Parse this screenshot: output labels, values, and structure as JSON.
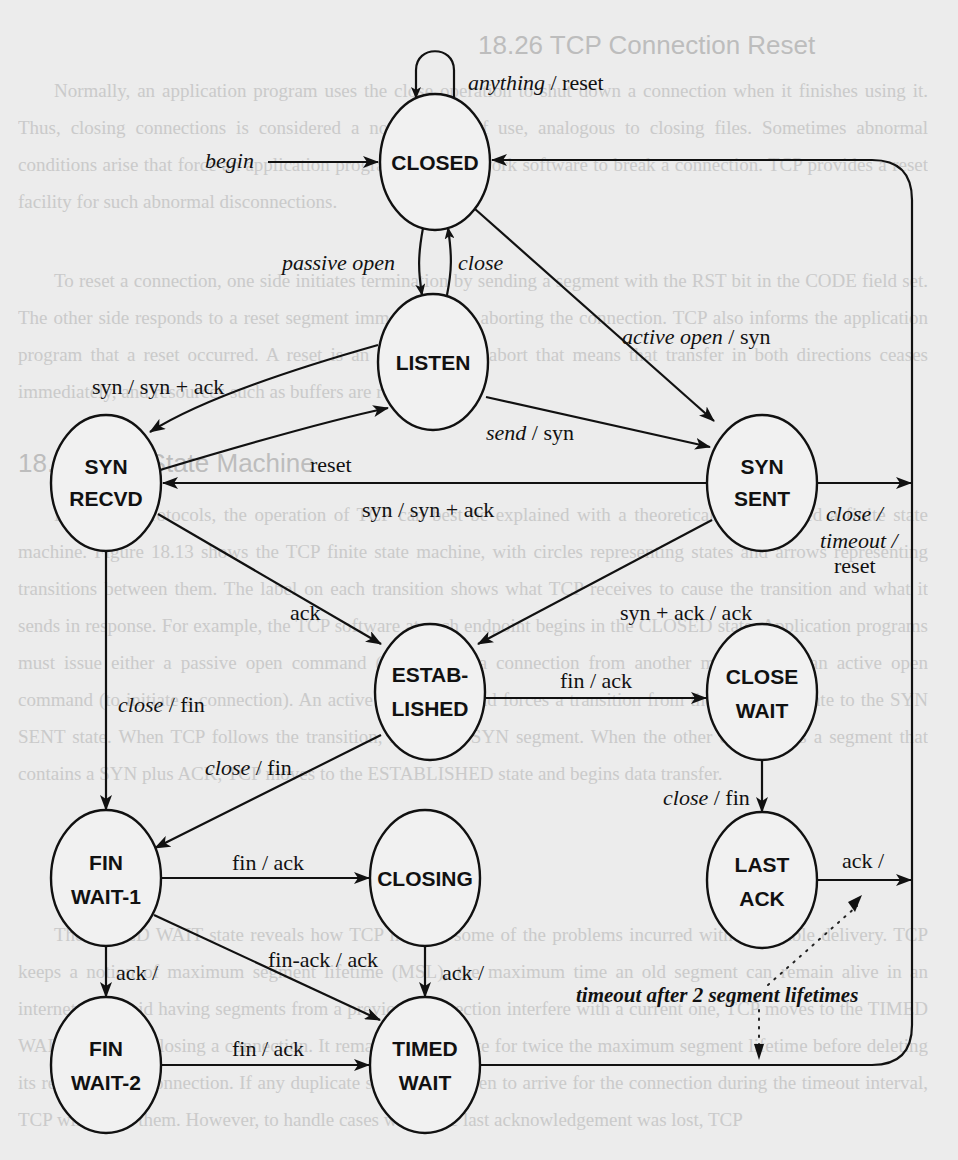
{
  "background_text": {
    "heading_1": "18.26 TCP Connection Reset",
    "para_1": "Normally, an application program uses the close operation to shut down a connection when it finishes using it. Thus, closing connections is considered a normal part of use, analogous to closing files. Sometimes abnormal conditions arise that force an application program or the network software to break a connection. TCP provides a reset facility for such abnormal disconnections.",
    "para_2": "To reset a connection, one side initiates termination by sending a segment with the RST bit in the CODE field set. The other side responds to a reset segment immediately by aborting the connection. TCP also informs the application program that a reset occurred. A reset is an instantaneous abort that means that transfer in both directions ceases immediately, and resources such as buffers are released.",
    "heading_2": "18.27 TCP State Machine",
    "para_3": "Like most protocols, the operation of TCP can best be explained with a theoretical model called a finite state machine. Figure 18.13 shows the TCP finite state machine, with circles representing states and arrows representing transitions between them. The label on each transition shows what TCP receives to cause the transition and what it sends in response. For example, the TCP software at each endpoint begins in the CLOSED state. Application programs must issue either a passive open command (to wait for a connection from another machine), or an active open command (to initiate a connection). An active open command forces a transition from the CLOSED state to the SYN SENT state. When TCP follows the transition, it emits a SYN segment. When the other end returns a segment that contains a SYN plus ACK, TCP moves to the ESTABLISHED state and begins data transfer.",
    "para_4": "The TIMED WAIT state reveals how TCP handles some of the problems incurred with unreliable delivery. TCP keeps a notion of maximum segment lifetime (MSL), the maximum time an old segment can remain alive in an internet. To avoid having segments from a previous connection interfere with a current one, TCP moves to the TIMED WAIT state after closing a connection. It remains in that state for twice the maximum segment lifetime before deleting its record of the connection. If any duplicate segments happen to arrive for the connection during the timeout interval, TCP will reject them. However, to handle cases where the last acknowledgement was lost, TCP"
  },
  "diagram": {
    "states": {
      "closed": [
        "CLOSED"
      ],
      "listen": [
        "LISTEN"
      ],
      "syn_recvd": [
        "SYN",
        "RECVD"
      ],
      "syn_sent": [
        "SYN",
        "SENT"
      ],
      "established": [
        "ESTAB-",
        "LISHED"
      ],
      "close_wait": [
        "CLOSE",
        "WAIT"
      ],
      "fin_wait_1": [
        "FIN",
        "WAIT-1"
      ],
      "closing": [
        "CLOSING"
      ],
      "last_ack": [
        "LAST",
        "ACK"
      ],
      "fin_wait_2": [
        "FIN",
        "WAIT-2"
      ],
      "timed_wait": [
        "TIMED",
        "WAIT"
      ]
    },
    "transitions": {
      "anything_reset": {
        "event": "anything",
        "action": " / reset"
      },
      "begin": {
        "event": "begin"
      },
      "passive_open": {
        "event": "passive open"
      },
      "close_listen": {
        "event": "close"
      },
      "active_open": {
        "event": "active open",
        "action": " / syn"
      },
      "listen_syn": {
        "label": "syn / syn + ack"
      },
      "send_syn": {
        "event": "send",
        "action": " / syn"
      },
      "reset": {
        "label": "reset"
      },
      "simultaneous_syn": {
        "label": "syn / syn + ack"
      },
      "syn_sent_close_1": {
        "event": "close /"
      },
      "syn_sent_close_2": {
        "event": "timeout /"
      },
      "syn_sent_close_3": {
        "label": "reset"
      },
      "ack": {
        "label": "ack"
      },
      "syn_ack_ack": {
        "label": "syn + ack / ack"
      },
      "recvd_close_fin": {
        "event": "close",
        "action": " / fin"
      },
      "fin_ack_est": {
        "label": "fin / ack"
      },
      "est_close_fin": {
        "event": "close",
        "action": " / fin"
      },
      "close_wait_close_fin": {
        "event": "close",
        "action": " / fin"
      },
      "fin_ack_fw1": {
        "label": "fin / ack"
      },
      "last_ack_ack": {
        "label": "ack /"
      },
      "fw1_ack": {
        "label": "ack /"
      },
      "fin_ack_ack": {
        "label": "fin-ack / ack"
      },
      "closing_ack": {
        "label": "ack /"
      },
      "fin_ack_fw2": {
        "label": "fin / ack"
      },
      "timeout_2msl": {
        "label": "timeout after 2 segment lifetimes"
      }
    }
  }
}
